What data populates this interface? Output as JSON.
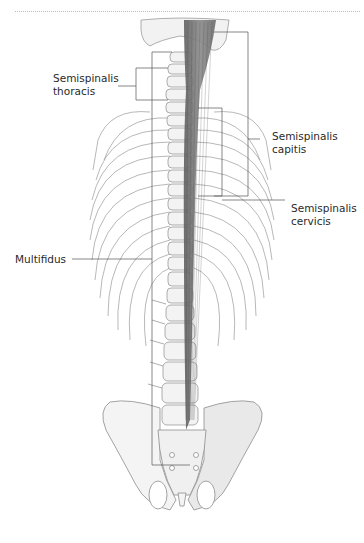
{
  "figure": {
    "type": "anatomical illustration",
    "colors": {
      "muscle": "#7d7d7d",
      "bone_fill": "#f4f4f4",
      "bone_outline": "#9a9a9a",
      "leader_line": "#555555",
      "separator": "#b9b9b9"
    }
  },
  "labels": {
    "semispinalis_thoracis": {
      "line1": "Semispinalis",
      "line2": "thoracis"
    },
    "semispinalis_capitis": {
      "line1": "Semispinalis",
      "line2": "capitis"
    },
    "semispinalis_cervicis": {
      "line1": "Semispinalis",
      "line2": "cervicis"
    },
    "multifidus": {
      "line1": "Multifidus"
    }
  }
}
